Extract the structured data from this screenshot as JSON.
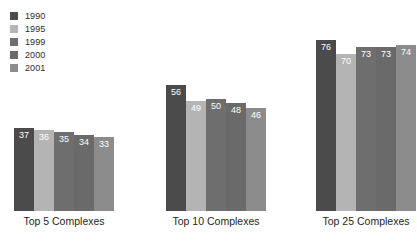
{
  "chart_data": {
    "type": "bar",
    "title": "",
    "subtitle": "",
    "xlabel": "",
    "ylabel": "",
    "ylim": [
      0,
      80
    ],
    "grid": false,
    "legend_position": "top-left",
    "categories": [
      "Top 5 Complexes",
      "Top 10 Complexes",
      "Top 25 Complexes"
    ],
    "series": [
      {
        "name": "1990",
        "color": "#4b4b4b",
        "values": [
          37,
          56,
          76
        ]
      },
      {
        "name": "1995",
        "color": "#b4b4b4",
        "values": [
          36,
          49,
          70
        ]
      },
      {
        "name": "1999",
        "color": "#6e6e6e",
        "values": [
          35,
          50,
          73
        ]
      },
      {
        "name": "2000",
        "color": "#6a6a6a",
        "values": [
          34,
          48,
          73
        ]
      },
      {
        "name": "2001",
        "color": "#8c8c8c",
        "values": [
          33,
          46,
          74
        ]
      }
    ],
    "value_label_color": "#ffffff",
    "background_color": "#ffffff"
  },
  "legend": {
    "items": [
      {
        "label": "1990",
        "color": "#4b4b4b"
      },
      {
        "label": "1995",
        "color": "#b4b4b4"
      },
      {
        "label": "1999",
        "color": "#6e6e6e"
      },
      {
        "label": "2000",
        "color": "#6a6a6a"
      },
      {
        "label": "2001",
        "color": "#8c8c8c"
      }
    ]
  },
  "groups": [
    {
      "label": "Top 5 Complexes",
      "left": 14,
      "bars": [
        {
          "series": "1990",
          "value": 37,
          "color": "#4b4b4b"
        },
        {
          "series": "1995",
          "value": 36,
          "color": "#b4b4b4"
        },
        {
          "series": "1999",
          "value": 35,
          "color": "#6e6e6e"
        },
        {
          "series": "2000",
          "value": 34,
          "color": "#6a6a6a"
        },
        {
          "series": "2001",
          "value": 33,
          "color": "#8c8c8c"
        }
      ]
    },
    {
      "label": "Top 10 Complexes",
      "left": 166,
      "bars": [
        {
          "series": "1990",
          "value": 56,
          "color": "#4b4b4b"
        },
        {
          "series": "1995",
          "value": 49,
          "color": "#b4b4b4"
        },
        {
          "series": "1999",
          "value": 50,
          "color": "#6e6e6e"
        },
        {
          "series": "2000",
          "value": 48,
          "color": "#6a6a6a"
        },
        {
          "series": "2001",
          "value": 46,
          "color": "#8c8c8c"
        }
      ]
    },
    {
      "label": "Top 25 Complexes",
      "left": 316,
      "bars": [
        {
          "series": "1990",
          "value": 76,
          "color": "#4b4b4b"
        },
        {
          "series": "1995",
          "value": 70,
          "color": "#b4b4b4"
        },
        {
          "series": "1999",
          "value": 73,
          "color": "#6e6e6e"
        },
        {
          "series": "2000",
          "value": 73,
          "color": "#6a6a6a"
        },
        {
          "series": "2001",
          "value": 74,
          "color": "#8c8c8c"
        }
      ]
    }
  ],
  "scale": {
    "px_per_unit": 2.25,
    "bar_width": 20
  }
}
